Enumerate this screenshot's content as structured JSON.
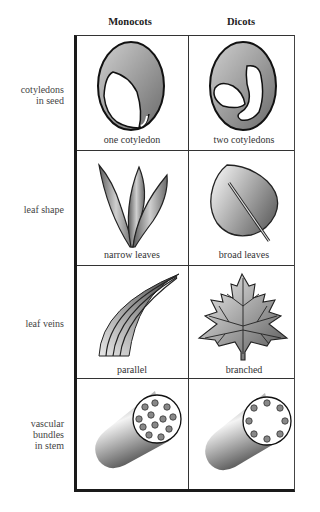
{
  "diagram": {
    "columns": [
      "Monocots",
      "Dicots"
    ],
    "rows": [
      {
        "label": "cotyledons\nin seed",
        "monocot": {
          "caption": "one cotyledon",
          "icon": "seed-one-cotyledon-icon"
        },
        "dicot": {
          "caption": "two cotyledons",
          "icon": "seed-two-cotyledons-icon"
        }
      },
      {
        "label": "leaf shape",
        "monocot": {
          "caption": "narrow leaves",
          "icon": "narrow-leaves-icon"
        },
        "dicot": {
          "caption": "broad leaves",
          "icon": "broad-leaf-icon"
        }
      },
      {
        "label": "leaf veins",
        "monocot": {
          "caption": "parallel",
          "icon": "parallel-veins-icon"
        },
        "dicot": {
          "caption": "branched",
          "icon": "branched-veins-maple-leaf-icon"
        }
      },
      {
        "label": "vascular\nbundles\nin stem",
        "monocot": {
          "caption": "",
          "icon": "scattered-vascular-bundles-stem-icon",
          "bundle_count": 12
        },
        "dicot": {
          "caption": "",
          "icon": "ring-vascular-bundles-stem-icon",
          "bundle_count": 8
        }
      }
    ],
    "colors": {
      "border": "#1a1a1a",
      "fill_dark": "#6e6e6e",
      "fill_light": "#e6e6e6"
    }
  }
}
